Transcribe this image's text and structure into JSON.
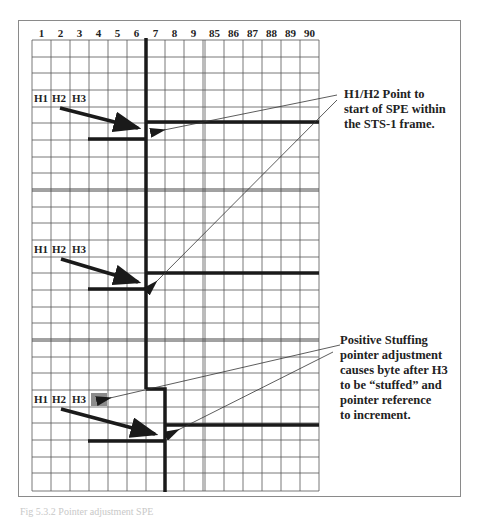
{
  "diagram": {
    "column_labels": [
      "1",
      "2",
      "3",
      "4",
      "5",
      "6",
      "7",
      "8",
      "9",
      "85",
      "86",
      "87",
      "88",
      "89",
      "90"
    ],
    "frames": [
      {
        "id": 1,
        "header_labels": {
          "h1": "H1",
          "h2": "H2",
          "h3": "H3"
        }
      },
      {
        "id": 2,
        "header_labels": {
          "h1": "H1",
          "h2": "H2",
          "h3": "H3"
        }
      },
      {
        "id": 3,
        "header_labels": {
          "h1": "H1",
          "h2": "H2",
          "h3": "H3"
        },
        "stuffed_byte": true
      }
    ],
    "annotations": {
      "pointer_note": "H1/H2 Point to start of SPE within the STS-1 frame.",
      "pointer_note_lines": [
        "H1/H2 Point to",
        "start of SPE within",
        "the STS-1 frame."
      ],
      "stuffing_note_lines": [
        "Positive Stuffing",
        "pointer adjustment",
        "causes byte after H3",
        "to be “stuffed” and",
        "pointer reference",
        "to increment."
      ]
    },
    "caption": "Fig 5.3.2 Pointer adjustment SPE",
    "colors": {
      "grid": "#555555",
      "thick_line": "#1a1a1a",
      "stuffed_byte": "#8c8c8c",
      "border": "#8a8a8a"
    }
  }
}
